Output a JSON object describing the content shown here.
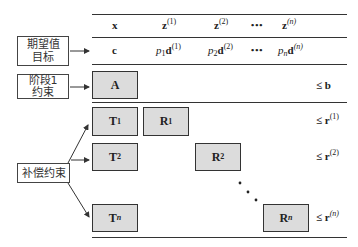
{
  "header_row": {
    "x": "x",
    "z1": "z",
    "z1_sup": "(1)",
    "z2": "z",
    "z2_sup": "(2)",
    "ellipsis": "•••",
    "zn": "z",
    "zn_sup": "(n)"
  },
  "objective_row": {
    "c": "c",
    "p1": "p",
    "p1_sub": "1",
    "d1": "d",
    "d1_sup": "(1)",
    "p2": "p",
    "p2_sub": "2",
    "d2": "d",
    "d2_sup": "(2)",
    "ellipsis": "•••",
    "pn": "p",
    "pn_sub": "n",
    "dn": "d",
    "dn_sup": "(n)"
  },
  "left_labels": {
    "objective": [
      "期望值",
      "目标"
    ],
    "stage1": [
      "阶段1",
      "约束"
    ],
    "recourse": "补偿约束"
  },
  "blocks": {
    "A": "A",
    "T1": "T",
    "T1_sub": "1",
    "R1": "R",
    "R1_sub": "1",
    "T2": "T",
    "T2_sub": "2",
    "R2": "R",
    "R2_sub": "2",
    "Tn": "T",
    "Tn_sub": "n",
    "Rn": "R",
    "Rn_sub": "n"
  },
  "rhs": {
    "b": "≤ b",
    "r1": "≤ r",
    "r1_sup": "(1)",
    "r2": "≤ r",
    "r2_sup": "(2)",
    "rn": "≤ r",
    "rn_sup": "(n)"
  },
  "colors": {
    "block_fill": "#dcdcdc",
    "line": "#333333"
  }
}
